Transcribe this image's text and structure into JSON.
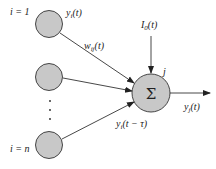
{
  "diagram": {
    "type": "neuron-model",
    "colors": {
      "node_fill": "#c8c8c8",
      "stroke": "#333333",
      "text": "#222222",
      "background": "#ffffff"
    },
    "input_nodes": [
      {
        "id": "input-1",
        "label": "i = 1",
        "output_label": "y_i(t)"
      },
      {
        "id": "input-2",
        "label": ""
      },
      {
        "id": "input-n",
        "label": "i = n"
      }
    ],
    "ellipsis": "⋮",
    "weight_label": "w_ij(t)",
    "delay_label": "y_i(t − τ)",
    "bias_label": "I_0(t)",
    "summation": {
      "symbol": "Σ",
      "node_label": "j"
    },
    "output_label": "y_j(t)"
  }
}
